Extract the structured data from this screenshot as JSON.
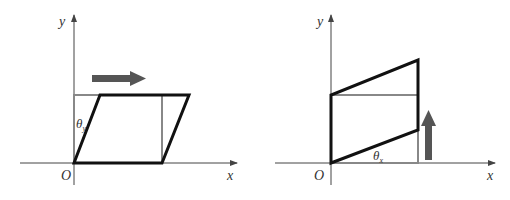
{
  "figures": [
    {
      "name": "shear-x",
      "labels": {
        "y_axis": "y",
        "x_axis": "x",
        "origin": "O",
        "angle": "θ",
        "angle_sub": "y"
      },
      "arrow_direction": "right"
    },
    {
      "name": "shear-y",
      "labels": {
        "y_axis": "y",
        "x_axis": "x",
        "origin": "O",
        "angle": "θ",
        "angle_sub": "x"
      },
      "arrow_direction": "up"
    }
  ],
  "colors": {
    "axis": "#444444",
    "original": "#888888",
    "sheared": "#111111",
    "arrow": "#555555"
  }
}
